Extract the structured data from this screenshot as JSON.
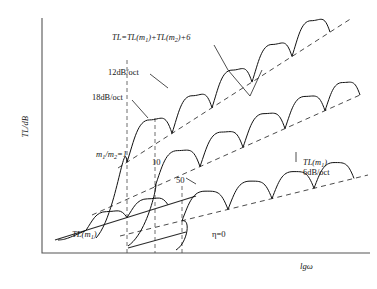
{
  "chart_data": {
    "type": "line",
    "title": "",
    "xlabel": "lgω",
    "ylabel": "TL/dB",
    "grid": false,
    "legend": "none",
    "axes": {
      "x0": 42,
      "y0": 253,
      "x1": 370,
      "y1": 18
    },
    "annotations": {
      "main_formula": "TL=TL(m₁)+TL(m₂)+6",
      "slope_12db": "12dB/oct",
      "slope_18db": "18dB/oct",
      "mass_ratio_1": "m₁/m₂=1",
      "mass_ratio_10": "10",
      "mass_ratio_50": "50",
      "right_asymptote_name": "TL(m₁)",
      "right_asymptote_slope": "6dB/oct",
      "base_asymptote": "TL(m₁)",
      "damping": "η=0"
    },
    "asymptotes": [
      {
        "name": "TL(m1) 6dB/oct lower dashed",
        "style": "dashed",
        "points": [
          [
            120,
            236
          ],
          [
            368,
            175
          ]
        ]
      },
      {
        "name": "middle dashed",
        "style": "dashed",
        "points": [
          [
            92,
            215
          ],
          [
            360,
            95
          ]
        ]
      },
      {
        "name": "upper dashed TL=TL(m1)+TL(m2)+6",
        "style": "dashed",
        "points": [
          [
            118,
            168
          ],
          [
            352,
            18
          ]
        ]
      },
      {
        "name": "base solid TL(m1)",
        "style": "solid",
        "points": [
          [
            55,
            240
          ],
          [
            196,
            196
          ]
        ]
      },
      {
        "name": "low solid segment",
        "style": "solid",
        "points": [
          [
            128,
            248
          ],
          [
            186,
            232
          ]
        ]
      }
    ],
    "vertical_guides": [
      127,
      155,
      182
    ],
    "curves": [
      {
        "name": "m1/m2=1",
        "label": "m₁/m₂=1",
        "rise_x": [
          96,
          132
        ],
        "rise_y": [
          238,
          60
        ],
        "notch_xs": [
          127,
          172,
          212,
          252,
          292,
          330
        ],
        "asym": [
          [
            118,
            168
          ],
          [
            352,
            18
          ]
        ],
        "arch_depth": 0.62
      },
      {
        "name": "m1/m2=10",
        "label": "10",
        "rise_x": [
          128,
          168
        ],
        "rise_y": [
          246,
          120
        ],
        "notch_xs": [
          155,
          200,
          243,
          285,
          325,
          360
        ],
        "asym": [
          [
            92,
            215
          ],
          [
            360,
            95
          ]
        ],
        "arch_depth": 0.58
      },
      {
        "name": "m1/m2=50",
        "label": "50",
        "rise_x": [
          176,
          196
        ],
        "rise_y": [
          250,
          196
        ],
        "notch_xs": [
          182,
          228,
          272,
          314,
          354
        ],
        "asym": [
          [
            120,
            236
          ],
          [
            368,
            175
          ]
        ],
        "arch_depth": 0.52
      },
      {
        "name": "baseline small notches",
        "label": "",
        "rise_x": [
          58,
          70
        ],
        "rise_y": [
          240,
          238
        ],
        "notch_xs": [
          86,
          127,
          168
        ],
        "asym": [
          [
            55,
            240
          ],
          [
            196,
            196
          ]
        ],
        "arch_depth": 0.3
      }
    ],
    "leaders": [
      {
        "name": "main-formula-leader",
        "points": [
          [
            214,
            45
          ],
          [
            228,
            70
          ],
          [
            250,
            96
          ],
          [
            262,
            70
          ]
        ]
      },
      {
        "name": "slope-12db-leader",
        "points": [
          [
            150,
            74
          ],
          [
            168,
            88
          ]
        ]
      },
      {
        "name": "slope-18db-leader",
        "points": [
          [
            132,
            100
          ],
          [
            148,
            118
          ]
        ]
      },
      {
        "name": "label-50-leader",
        "points": [
          [
            186,
            178
          ],
          [
            196,
            184
          ]
        ]
      },
      {
        "name": "right-asymptote-leader",
        "points": [
          [
            296,
            152
          ],
          [
            296,
            162
          ]
        ]
      }
    ]
  },
  "labels": {
    "main_formula_pre": "TL=TL(",
    "main": "TL=TL(m",
    "y_axis": "TL/dB",
    "x_axis": "lgω"
  }
}
